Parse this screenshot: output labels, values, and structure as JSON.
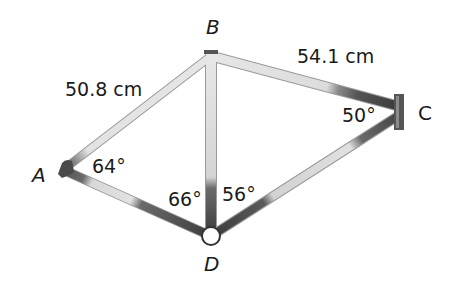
{
  "figure": {
    "type": "bicycle-frame-quadrilateral",
    "vertices": {
      "A": {
        "label": "A",
        "x": 66,
        "y": 168
      },
      "B": {
        "label": "B",
        "x": 211,
        "y": 52
      },
      "C": {
        "label": "C",
        "x": 398,
        "y": 112
      },
      "D": {
        "label": "D",
        "x": 211,
        "y": 236
      }
    },
    "sides": {
      "AB": {
        "label": "50.8 cm"
      },
      "BC": {
        "label": "54.1 cm"
      }
    },
    "angles": {
      "A": {
        "label": "64°"
      },
      "C": {
        "label": "50°"
      },
      "ADB": {
        "label": "66°"
      },
      "BDC": {
        "label": "56°"
      }
    },
    "colors": {
      "tube_light": "#e4e4e4",
      "tube_mid": "#bdbdbd",
      "tube_dark": "#4a4a4a",
      "tube_edge": "#8c8c8c",
      "text": "#1a1a1a"
    }
  }
}
